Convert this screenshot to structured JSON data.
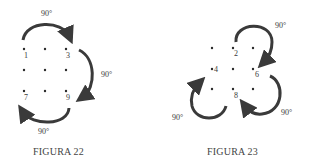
{
  "figures": [
    {
      "caption": "FIGURA 22",
      "grid_labels": [
        "1",
        "3",
        "7",
        "9"
      ],
      "rotation_labels": [
        "90°",
        "90°",
        "90°"
      ]
    },
    {
      "caption": "FIGURA 23",
      "grid_labels": [
        "2",
        "4",
        "6",
        "8"
      ],
      "rotation_labels": [
        "90°",
        "90°",
        "90°"
      ]
    }
  ],
  "colors": {
    "arrow": "#3a3a3a",
    "dot": "#2a2a2a",
    "text": "#3a3a3a"
  }
}
